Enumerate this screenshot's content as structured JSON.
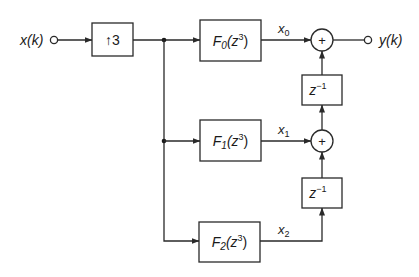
{
  "diagram": {
    "type": "block-diagram",
    "input": {
      "label": "x(k)"
    },
    "output": {
      "label": "y(k)"
    },
    "upsampler": {
      "label": "↑3",
      "arrow": "↑",
      "factor": "3"
    },
    "filters": [
      {
        "name": "F",
        "sub": "0",
        "arg": "(z",
        "exp": "3",
        "close": ")",
        "signal": "x",
        "signal_sub": "0"
      },
      {
        "name": "F",
        "sub": "1",
        "arg": "(z",
        "exp": "3",
        "close": ")",
        "signal": "x",
        "signal_sub": "1"
      },
      {
        "name": "F",
        "sub": "2",
        "arg": "(z",
        "exp": "3",
        "close": ")",
        "signal": "x",
        "signal_sub": "2"
      }
    ],
    "adders": [
      {
        "symbol": "+"
      },
      {
        "symbol": "+"
      }
    ],
    "delays": [
      {
        "base": "z",
        "exp": "−1"
      },
      {
        "base": "z",
        "exp": "−1"
      }
    ],
    "colors": {
      "line": "#2a2a2a",
      "background": "#ffffff",
      "text": "#1a1a1a"
    }
  }
}
